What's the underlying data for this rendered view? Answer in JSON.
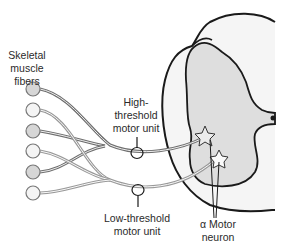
{
  "diagram": {
    "type": "motor-unit-recruitment",
    "labels": {
      "skeletal_muscle_fibers": "Skeletal\nmuscle\nfibers",
      "high_threshold": "High-\nthreshold\nmotor unit",
      "low_threshold": "Low-threshold\nmotor unit",
      "alpha_motor_neuron": "α Motor\nneuron"
    },
    "muscle_fibers": [
      {
        "index": 1,
        "fill": "#d6d6d6",
        "unit": "high-threshold"
      },
      {
        "index": 2,
        "fill": "#f4f4f4",
        "unit": "low-threshold"
      },
      {
        "index": 3,
        "fill": "#d6d6d6",
        "unit": "high-threshold"
      },
      {
        "index": 4,
        "fill": "#f4f4f4",
        "unit": "low-threshold"
      },
      {
        "index": 5,
        "fill": "#d6d6d6",
        "unit": "high-threshold"
      },
      {
        "index": 6,
        "fill": "#f4f4f4",
        "unit": "low-threshold"
      }
    ],
    "colors": {
      "outline": "#1a1a1a",
      "gray_matter": "#dedede",
      "white_matter": "#f5f5f5",
      "axon": "#8a8a8a"
    }
  }
}
